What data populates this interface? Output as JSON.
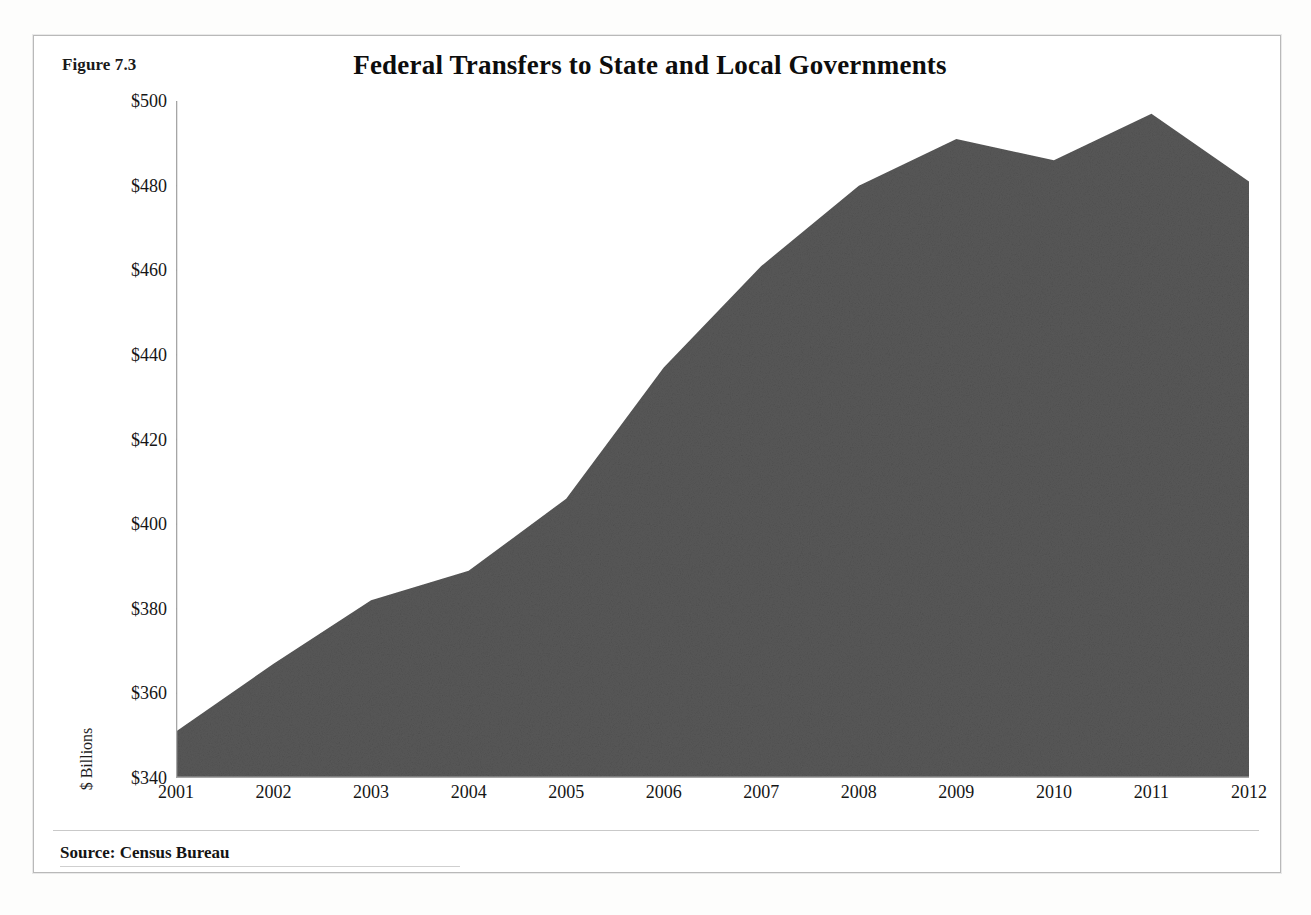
{
  "figure": {
    "label": "Figure 7.3",
    "source_note": "Source: Census Bureau"
  },
  "chart_data": {
    "type": "area",
    "title": "Federal Transfers to State and Local Governments",
    "xlabel": "",
    "ylabel": "$ Billions",
    "categories": [
      "2001",
      "2002",
      "2003",
      "2004",
      "2005",
      "2006",
      "2007",
      "2008",
      "2009",
      "2010",
      "2011",
      "2012"
    ],
    "x": [
      2001,
      2002,
      2003,
      2004,
      2005,
      2006,
      2007,
      2008,
      2009,
      2010,
      2011,
      2012
    ],
    "values": [
      351,
      367,
      382,
      389,
      406,
      437,
      461,
      480,
      491,
      486,
      497,
      481
    ],
    "series": [
      {
        "name": "Federal Transfers to State and Local Governments",
        "values": [
          351,
          367,
          382,
          389,
          406,
          437,
          461,
          480,
          491,
          486,
          497,
          481
        ]
      }
    ],
    "ylim": [
      340,
      500
    ],
    "xlim": [
      2001,
      2012
    ],
    "ytick_labels": [
      "$500",
      "$480",
      "$460",
      "$440",
      "$420",
      "$400",
      "$380",
      "$360",
      "$340"
    ],
    "ytick_values": [
      500,
      480,
      460,
      440,
      420,
      400,
      380,
      360,
      340
    ],
    "xtick_labels": [
      "2001",
      "2002",
      "2003",
      "2004",
      "2005",
      "2006",
      "2007",
      "2008",
      "2009",
      "2010",
      "2011",
      "2012"
    ],
    "grid": false,
    "legend": "none",
    "fill_color": "#595959",
    "axis_color": "#9a9a9a"
  }
}
